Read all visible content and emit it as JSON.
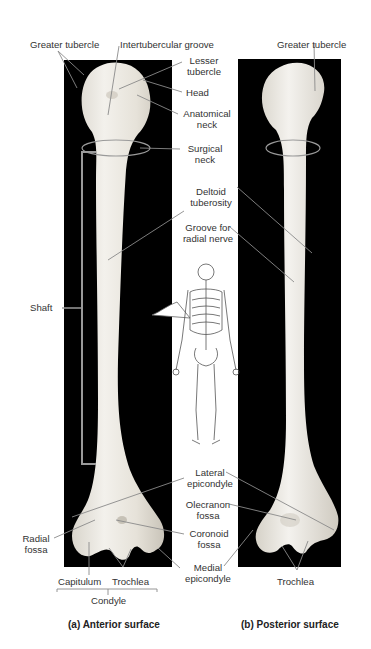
{
  "figure": {
    "panel_a": {
      "caption": "(a) Anterior surface",
      "labels": {
        "greater_tubercle": "Greater tubercle",
        "intertubercular_groove": "Intertubercular groove",
        "lesser_tubercle_1": "Lesser",
        "lesser_tubercle_2": "tubercle",
        "head": "Head",
        "anatomical_neck_1": "Anatomical",
        "anatomical_neck_2": "neck",
        "surgical_neck_1": "Surgical",
        "surgical_neck_2": "neck",
        "deltoid_tuberosity_1": "Deltoid",
        "deltoid_tuberosity_2": "tuberosity",
        "shaft": "Shaft",
        "radial_fossa_1": "Radial",
        "radial_fossa_2": "fossa",
        "lateral_epicondyle_1": "Lateral",
        "lateral_epicondyle_2": "epicondyle",
        "coronoid_fossa_1": "Coronoid",
        "coronoid_fossa_2": "fossa",
        "medial_epicondyle_1": "Medial",
        "medial_epicondyle_2": "epicondyle",
        "capitulum": "Capitulum",
        "trochlea": "Trochlea",
        "condyle": "Condyle"
      }
    },
    "panel_b": {
      "caption": "(b) Posterior surface",
      "labels": {
        "greater_tubercle": "Greater tubercle",
        "groove_radial_nerve_1": "Groove for",
        "groove_radial_nerve_2": "radial nerve",
        "olecranon_fossa_1": "Olecranon",
        "olecranon_fossa_2": "fossa",
        "trochlea": "Trochlea"
      }
    },
    "colors": {
      "panel_bg": "#000000",
      "bone": "#ece9e2",
      "bone_shade": "#cfcac0",
      "leader_line": "#8a8a8a",
      "text": "#333333"
    }
  }
}
